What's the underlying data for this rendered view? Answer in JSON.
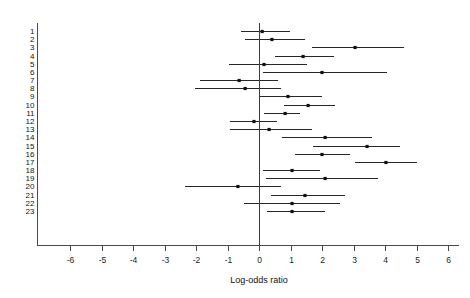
{
  "chart_data": {
    "type": "forest",
    "title": "",
    "xlabel": "Log-odds ratio",
    "ylabel": "",
    "xlim": [
      -6.6,
      6.3
    ],
    "xticks": [
      -6,
      -5,
      -4,
      -3,
      -2,
      -1,
      0,
      1,
      2,
      3,
      4,
      5,
      6
    ],
    "xticklabels": [
      "-6",
      "-5",
      "-4",
      "-3",
      "-2",
      "-1",
      "0",
      "1",
      "2",
      "3",
      "4",
      "5",
      "6"
    ],
    "grid": false,
    "legend": null,
    "reference_line": 0,
    "marker": "filled-square",
    "categories": [
      "1",
      "2",
      "3",
      "4",
      "5",
      "6",
      "7",
      "8",
      "9",
      "10",
      "11",
      "12",
      "13",
      "14",
      "15",
      "16",
      "17",
      "18",
      "19",
      "20",
      "21",
      "22",
      "23"
    ],
    "studies": [
      {
        "label": "1",
        "estimate": 0.1,
        "ci_low": -0.57,
        "ci_high": 0.98
      },
      {
        "label": "2",
        "estimate": 0.41,
        "ci_low": -0.44,
        "ci_high": 1.46
      },
      {
        "label": "3",
        "estimate": 3.05,
        "ci_low": 1.68,
        "ci_high": 4.6
      },
      {
        "label": "4",
        "estimate": 1.4,
        "ci_low": 0.51,
        "ci_high": 2.38
      },
      {
        "label": "5",
        "estimate": 0.16,
        "ci_low": -0.95,
        "ci_high": 1.52
      },
      {
        "label": "6",
        "estimate": 2.0,
        "ci_low": 0.13,
        "ci_high": 4.06
      },
      {
        "label": "7",
        "estimate": -0.63,
        "ci_low": -1.87,
        "ci_high": 0.6
      },
      {
        "label": "8",
        "estimate": -0.44,
        "ci_low": -2.03,
        "ci_high": 0.7
      },
      {
        "label": "9",
        "estimate": 0.92,
        "ci_low": 0.0,
        "ci_high": 2.0
      },
      {
        "label": "10",
        "estimate": 1.56,
        "ci_low": 0.79,
        "ci_high": 2.41
      },
      {
        "label": "11",
        "estimate": 0.83,
        "ci_low": 0.16,
        "ci_high": 1.3
      },
      {
        "label": "12",
        "estimate": -0.16,
        "ci_low": -0.92,
        "ci_high": 0.57
      },
      {
        "label": "13",
        "estimate": 0.32,
        "ci_low": -0.92,
        "ci_high": 1.68
      },
      {
        "label": "14",
        "estimate": 2.1,
        "ci_low": 0.73,
        "ci_high": 3.59
      },
      {
        "label": "15",
        "estimate": 3.43,
        "ci_low": 1.71,
        "ci_high": 4.48
      },
      {
        "label": "16",
        "estimate": 2.0,
        "ci_low": 1.14,
        "ci_high": 2.89
      },
      {
        "label": "17",
        "estimate": 4.03,
        "ci_low": 3.05,
        "ci_high": 5.02
      },
      {
        "label": "18",
        "estimate": 1.05,
        "ci_low": 0.13,
        "ci_high": 1.94
      },
      {
        "label": "19",
        "estimate": 2.1,
        "ci_low": 0.22,
        "ci_high": 3.78
      },
      {
        "label": "20",
        "estimate": -0.67,
        "ci_low": -2.35,
        "ci_high": 0.7
      },
      {
        "label": "21",
        "estimate": 1.46,
        "ci_low": 0.38,
        "ci_high": 2.73
      },
      {
        "label": "22",
        "estimate": 1.05,
        "ci_low": -0.48,
        "ci_high": 2.57
      },
      {
        "label": "23",
        "estimate": 1.05,
        "ci_low": 0.25,
        "ci_high": 2.1
      }
    ]
  }
}
